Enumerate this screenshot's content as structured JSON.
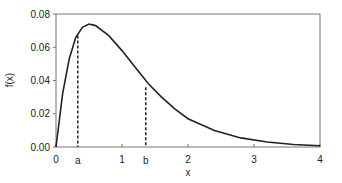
{
  "chart_data": {
    "type": "line",
    "title": "",
    "xlabel": "x",
    "ylabel": "f(x)",
    "xlim": [
      0,
      4
    ],
    "ylim": [
      0,
      0.08
    ],
    "x_ticks": [
      "0",
      "1",
      "2",
      "3",
      "4"
    ],
    "y_ticks": [
      "0.00",
      "0.02",
      "0.04",
      "0.06",
      "0.08"
    ],
    "grid": false,
    "series": [
      {
        "name": "f(x)",
        "x": [
          0,
          0.1,
          0.2,
          0.3,
          0.4,
          0.5,
          0.6,
          0.8,
          1.0,
          1.2,
          1.4,
          1.6,
          1.8,
          2.0,
          2.4,
          2.8,
          3.2,
          3.6,
          4.0
        ],
        "y": [
          0,
          0.032,
          0.053,
          0.066,
          0.072,
          0.074,
          0.073,
          0.067,
          0.058,
          0.048,
          0.038,
          0.03,
          0.023,
          0.017,
          0.01,
          0.0055,
          0.003,
          0.0015,
          0.0008
        ]
      }
    ],
    "annotations": [
      {
        "label": "a",
        "x": 0.33,
        "y": 0.067,
        "style": "dashed vertical"
      },
      {
        "label": "b",
        "x": 1.36,
        "y": 0.036,
        "style": "dashed vertical"
      }
    ]
  }
}
